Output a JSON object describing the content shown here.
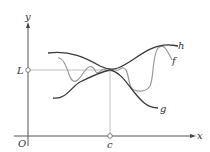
{
  "figure": {
    "axes": {
      "x_label": "x",
      "y_label": "y",
      "origin_label": "O"
    },
    "points": {
      "limit_label": "L",
      "c_label": "c"
    },
    "curves": [
      {
        "name": "h",
        "label": "h",
        "color": "#3a3a3a",
        "role": "upper bound"
      },
      {
        "name": "f",
        "label": "f",
        "color": "#9a9a9a",
        "role": "squeezed function"
      },
      {
        "name": "g",
        "label": "g",
        "color": "#3a3a3a",
        "role": "lower bound"
      }
    ],
    "colors": {
      "axis": "#555555",
      "guide": "#a8a8a8",
      "dark_curve": "#3a3a3a",
      "light_curve": "#9a9a9a"
    }
  }
}
